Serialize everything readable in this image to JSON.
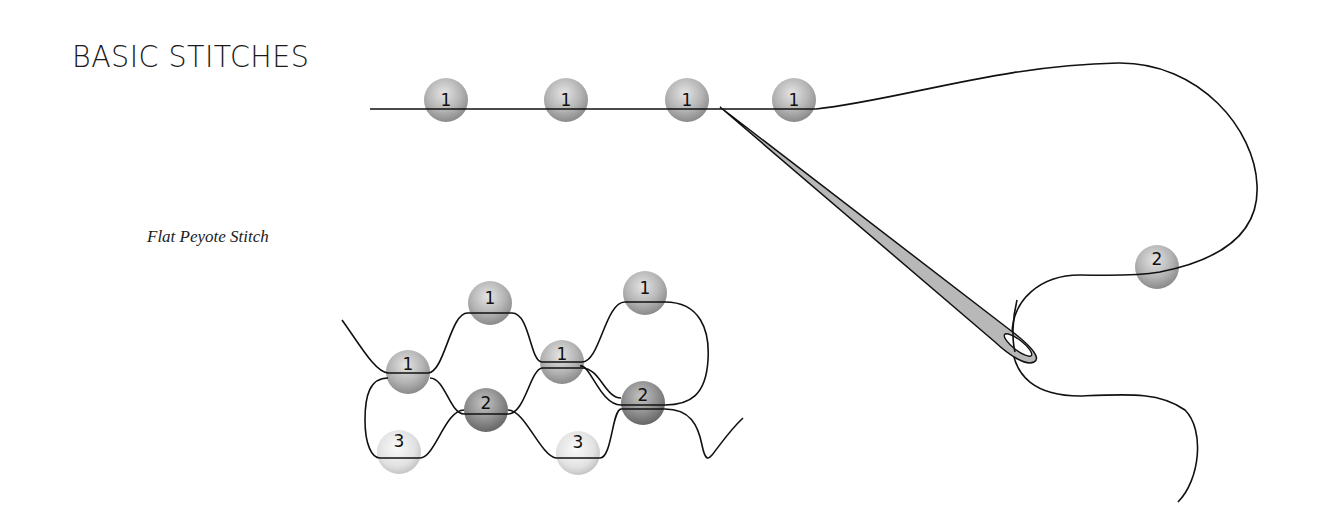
{
  "title": "BASIC STITCHES",
  "subtitle": "Flat Peyote Stitch",
  "colors": {
    "bead_row1": "#a8a8a8",
    "bead_row2": "#8c8c8c",
    "bead_row3": "#dcdcdc",
    "thread": "#111111",
    "needle": "#b8b8b8"
  },
  "top_diagram": {
    "beads": [
      {
        "label": "1",
        "x": 446,
        "y": 100
      },
      {
        "label": "1",
        "x": 566,
        "y": 100
      },
      {
        "label": "1",
        "x": 687,
        "y": 100
      },
      {
        "label": "1",
        "x": 794,
        "y": 100
      },
      {
        "label": "2",
        "x": 1157,
        "y": 267
      }
    ]
  },
  "peyote_diagram": {
    "beads": [
      {
        "label": "1",
        "x": 490,
        "y": 303,
        "row": 1
      },
      {
        "label": "1",
        "x": 645,
        "y": 293,
        "row": 1
      },
      {
        "label": "1",
        "x": 408,
        "y": 372,
        "row": 1
      },
      {
        "label": "1",
        "x": 562,
        "y": 362,
        "row": 1
      },
      {
        "label": "2",
        "x": 486,
        "y": 410,
        "row": 2
      },
      {
        "label": "2",
        "x": 643,
        "y": 403,
        "row": 2
      },
      {
        "label": "3",
        "x": 399,
        "y": 452,
        "row": 3
      },
      {
        "label": "3",
        "x": 578,
        "y": 453,
        "row": 3
      }
    ]
  }
}
